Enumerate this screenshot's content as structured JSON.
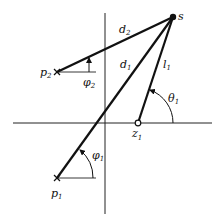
{
  "diagram": {
    "type": "pole-zero geometry (root locus angle/magnitude construction)",
    "colors": {
      "ink": "#111111",
      "background": "#ffffff"
    },
    "labels": {
      "s": "s",
      "p1": {
        "base": "p",
        "sub": "1"
      },
      "p2": {
        "base": "p",
        "sub": "2"
      },
      "z1": {
        "base": "z",
        "sub": "1"
      },
      "d1": {
        "base": "d",
        "sub": "1"
      },
      "d2": {
        "base": "d",
        "sub": "2"
      },
      "l1": {
        "base": "l",
        "sub": "1"
      },
      "phi1": {
        "base": "φ",
        "sub": "1"
      },
      "phi2": {
        "base": "φ",
        "sub": "2"
      },
      "theta1": {
        "base": "θ",
        "sub": "1"
      }
    },
    "points": {
      "s": {
        "kind": "filled-dot",
        "x": 173,
        "y": 17
      },
      "p1": {
        "kind": "cross",
        "x": 57,
        "y": 178
      },
      "p2": {
        "kind": "cross",
        "x": 57,
        "y": 72
      },
      "z1": {
        "kind": "open-circle",
        "x": 138,
        "y": 123
      }
    },
    "axes": {
      "vertical": {
        "x": 105,
        "y1": 13,
        "y2": 214
      },
      "horizontal": {
        "y": 123,
        "x1": 13,
        "x2": 212
      }
    }
  }
}
